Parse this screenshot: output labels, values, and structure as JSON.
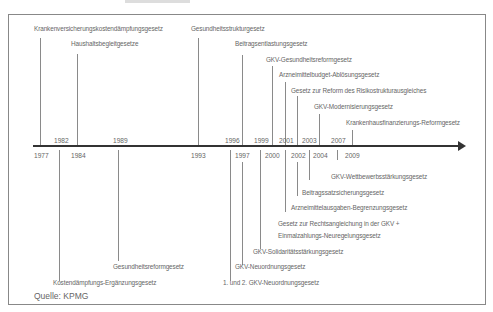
{
  "diagram": {
    "type": "timeline",
    "source": "Quelle: KPMG",
    "laws_above": [
      {
        "year": "1977",
        "label": "Krankenversicherungskostendämpfungsgesetz"
      },
      {
        "year": "1982",
        "label": "Haushaltsbegleitgesetze"
      },
      {
        "year": "1993",
        "label": "Gesundheitsstrukturgesetz"
      },
      {
        "year": "1996",
        "label": "Beitragsentlastungsgesetz"
      },
      {
        "year": "1999",
        "label": "GKV-Gesundheitsreformgesetz"
      },
      {
        "year": "2001",
        "label": "Arzneimittelbudget-Ablösungsgesetz"
      },
      {
        "year": "2001",
        "label": "Gesetz zur Reform des Risikostrukturausgleiches"
      },
      {
        "year": "2003",
        "label": "GKV-Modernisierungsgesetz"
      },
      {
        "year": "2007",
        "label": "Krankenhausfinanzierungs-Reformgesetz"
      }
    ],
    "laws_below": [
      {
        "year": "2009",
        "label": "GKV-Wettbewerbsstärkungsgesetz"
      },
      {
        "year": "2002",
        "label": "Beitragssatzsicherungsgesetz"
      },
      {
        "year": "2002",
        "label": "Arzneimittelausgaben-Begrenzungsgesetz"
      },
      {
        "year": "2000",
        "label": "Gesetz zur Rechtsangleichung in der GKV +"
      },
      {
        "year": "2000",
        "label": "Einmalzahlungs-Neuregelungsgesetz"
      },
      {
        "year": "1997",
        "label": "GKV-Solidaritätsstärkungsgesetz"
      },
      {
        "year": "1997",
        "label": "GKV-Neuordnungsgesetz"
      },
      {
        "year": "1989",
        "label": "Gesundheitsreformgesetz"
      },
      {
        "year": "1997",
        "label": "1. und 2. GKV-Neuordnungsgesetz"
      },
      {
        "year": "1984",
        "label": "Kostendämpfungs-Ergänzungsgesetz"
      }
    ],
    "years_above_axis": [
      "1982",
      "1989",
      "1996",
      "1999",
      "2001",
      "2003",
      "2007"
    ],
    "years_below_axis": [
      "1977",
      "1984",
      "1993",
      "1997",
      "2000",
      "2002",
      "2004",
      "2009"
    ]
  }
}
